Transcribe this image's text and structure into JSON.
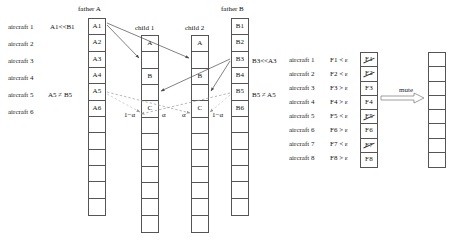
{
  "figure": {
    "type": "crossover-mutation-diagram",
    "headers": {
      "father_a": "father A",
      "father_b": "father B",
      "child1": "child 1",
      "child2": "child 2"
    },
    "left_row_labels": [
      "aircraft 1",
      "aircraft 2",
      "aircraft 3",
      "aircraft 4",
      "aircraft 5",
      "aircraft 6"
    ],
    "father_a": {
      "cells": [
        "A1",
        "A2",
        "A3",
        "A4",
        "A5",
        "A6",
        "",
        "",
        "",
        "",
        "",
        ""
      ],
      "annotations": [
        {
          "text": "A1<<B1",
          "row": 0
        },
        {
          "text": "A5 ≠ B5",
          "row": 4
        }
      ]
    },
    "father_b": {
      "cells": [
        "B1",
        "B2",
        "B3",
        "B4",
        "B5",
        "B6",
        "",
        "",
        "",
        "",
        "",
        ""
      ],
      "annotations": [
        {
          "text": "B3<<A3",
          "row": 2
        },
        {
          "text": "B5 ≠ A5",
          "row": 4
        }
      ]
    },
    "child1": {
      "cells": [
        "A",
        "",
        "B",
        "",
        "C",
        "",
        "",
        "",
        "",
        "",
        "",
        ""
      ]
    },
    "child2": {
      "cells": [
        "A",
        "",
        "B",
        "",
        "C",
        "",
        "",
        "",
        "",
        "",
        "",
        ""
      ]
    },
    "alpha_labels": {
      "child1_left": "1−α",
      "child1_right": "α",
      "child2_left": "α",
      "child2_right": "1−α"
    },
    "mutation": {
      "arrow_label": "mute",
      "row_labels": [
        "aircraft 1",
        "aircraft 2",
        "aircraft 3",
        "aircraft 4",
        "aircraft 5",
        "aircraft 6",
        "aircraft 7",
        "aircraft 8"
      ],
      "conditions": [
        "F1 < ε",
        "F2 < ε",
        "F3 > ε",
        "F4 > ε",
        "F5 < ε",
        "F6 > ε",
        "F7 < ε",
        "F8 > ε"
      ],
      "source_cells": [
        {
          "text": "F1",
          "struck": true
        },
        {
          "text": "F2",
          "struck": true
        },
        {
          "text": "F3",
          "struck": false
        },
        {
          "text": "F4",
          "struck": false
        },
        {
          "text": "F5",
          "struck": true
        },
        {
          "text": "F6",
          "struck": false
        },
        {
          "text": "F7",
          "struck": true
        },
        {
          "text": "F8",
          "struck": false
        }
      ],
      "result_cells": [
        "",
        "",
        "",
        "",
        "",
        "",
        "",
        ""
      ]
    },
    "colors": {
      "stroke": "#555555",
      "text": "#111111",
      "arrow_solid": "#4a4a4a",
      "arrow_dashed": "#8a8a8a",
      "background": "#ffffff"
    }
  }
}
